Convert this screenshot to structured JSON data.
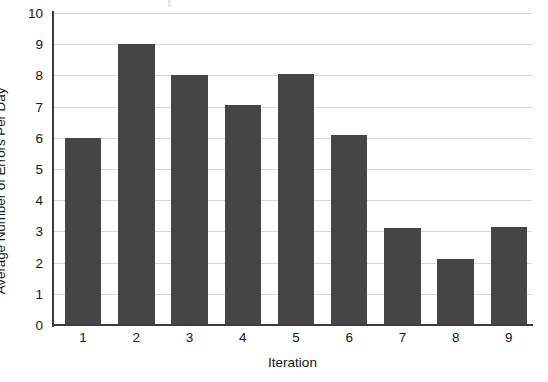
{
  "chart_data": {
    "type": "bar",
    "title": "",
    "xlabel": "Iteration",
    "ylabel": "Average Number of Errors Per Day",
    "categories": [
      "1",
      "2",
      "3",
      "4",
      "5",
      "6",
      "7",
      "8",
      "9"
    ],
    "values": [
      6.0,
      9.0,
      8.0,
      7.05,
      8.05,
      6.1,
      3.1,
      2.1,
      3.15
    ],
    "ylim": [
      0,
      10
    ],
    "ytick_labels": [
      "0",
      "1",
      "2",
      "3",
      "4",
      "5",
      "6",
      "7",
      "8",
      "9",
      "10"
    ],
    "ytick_values": [
      0,
      1,
      2,
      3,
      4,
      5,
      6,
      7,
      8,
      9,
      10
    ],
    "grid": true,
    "legend": "none",
    "series": [
      {
        "name": "Average Number of Errors Per Day",
        "values": [
          6.0,
          9.0,
          8.0,
          7.05,
          8.05,
          6.1,
          3.1,
          2.1,
          3.15
        ]
      }
    ]
  },
  "colors": {
    "bar": "#454545",
    "gridline": "#d8d8d8",
    "axis": "#3c3c3c",
    "background": "#ffffff",
    "text": "#161616"
  }
}
